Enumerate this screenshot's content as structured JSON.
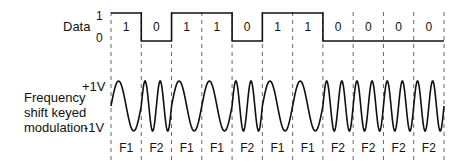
{
  "data_signal": {
    "label": "Data",
    "level_high": "1",
    "level_low": "0",
    "bits": [
      "1",
      "0",
      "1",
      "1",
      "0",
      "1",
      "1",
      "0",
      "0",
      "0",
      "0"
    ]
  },
  "fsk_signal": {
    "label_lines": [
      "Frequency",
      "shift keyed",
      "modulation"
    ],
    "v_high": "+1V",
    "v_low": "-1V",
    "freqs": [
      "F1",
      "F2",
      "F1",
      "F1",
      "F2",
      "F1",
      "F1",
      "F2",
      "F2",
      "F2",
      "F2"
    ]
  },
  "legend": {
    "F1_cycles_per_bit": 1,
    "F2_cycles_per_bit": 2
  },
  "colors": {
    "line": "#111111",
    "dash": "#555555",
    "background": "#ffffff"
  }
}
